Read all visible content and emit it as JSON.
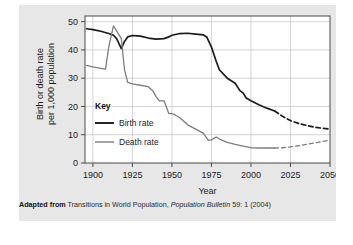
{
  "figure": {
    "y_axis_label_line1": "Birth or death rate",
    "y_axis_label_line2": "per 1,000 population",
    "x_axis_label": "Year",
    "key_title": "Key",
    "caption_prefix": "Adapted from",
    "caption_source": "Transitions in World Population,",
    "caption_italic": "Population Bulletin",
    "caption_suffix": "59: 1 (2004)"
  },
  "colors": {
    "panel_background": "#e7e7e7",
    "plot_background": "#ffffff",
    "gridline": "#c9c9c9",
    "axis": "#4a4a4a",
    "birth_rate_line": "#1b1b1b",
    "death_rate_line": "#7d7d7d",
    "text": "#1b1b1b"
  },
  "chart_data": {
    "type": "line",
    "title": "",
    "xlabel": "Year",
    "ylabel": "Birth or death rate per 1,000 population",
    "xlim": [
      1895,
      2050
    ],
    "ylim": [
      0,
      52
    ],
    "xticks": [
      1900,
      1925,
      1950,
      1975,
      2000,
      2025,
      2050
    ],
    "xtick_labels": [
      "1900",
      "1925",
      "1950",
      "1975",
      "2000",
      "2025",
      "2050"
    ],
    "yticks": [
      0,
      10,
      20,
      30,
      40,
      50
    ],
    "ytick_labels": [
      "0",
      "10",
      "20",
      "30",
      "40",
      "50"
    ],
    "grid": true,
    "legend_position": "inside-lower-left",
    "series": [
      {
        "name": "Birth rate",
        "color": "#1b1b1b",
        "style": "solid",
        "x": [
          1896,
          1900,
          1905,
          1910,
          1913,
          1915,
          1918,
          1920,
          1922,
          1925,
          1928,
          1930,
          1935,
          1940,
          1945,
          1948,
          1950,
          1955,
          1960,
          1965,
          1970,
          1972,
          1975,
          1978,
          1980,
          1985,
          1990,
          1993,
          1995,
          1997,
          2000,
          2005,
          2010,
          2015
        ],
        "y": [
          47.5,
          47.2,
          46.6,
          45.8,
          45.2,
          44.0,
          40.5,
          43.0,
          44.6,
          45.1,
          45.0,
          44.9,
          44.2,
          43.8,
          44.0,
          44.6,
          45.2,
          45.8,
          45.9,
          45.6,
          45.3,
          44.6,
          41.0,
          36.0,
          33.0,
          30.0,
          28.2,
          25.6,
          24.8,
          23.0,
          22.0,
          20.6,
          19.4,
          18.4
        ]
      },
      {
        "name": "Birth rate (projected)",
        "color": "#1b1b1b",
        "style": "dashed",
        "x": [
          2015,
          2020,
          2025,
          2030,
          2035,
          2040,
          2045,
          2050
        ],
        "y": [
          18.4,
          16.5,
          15.0,
          14.0,
          13.3,
          12.7,
          12.3,
          12.0
        ]
      },
      {
        "name": "Death rate",
        "color": "#7d7d7d",
        "style": "solid",
        "x": [
          1896,
          1900,
          1905,
          1908,
          1910,
          1913,
          1918,
          1920,
          1922,
          1925,
          1930,
          1935,
          1938,
          1940,
          1942,
          1945,
          1948,
          1950,
          1952,
          1955,
          1960,
          1965,
          1970,
          1973,
          1975,
          1978,
          1980,
          1982,
          1985,
          1990,
          1995,
          2000,
          2005,
          2010,
          2015
        ],
        "y": [
          34.5,
          34.0,
          33.5,
          33.2,
          41.0,
          48.5,
          44.0,
          33.0,
          28.5,
          28.0,
          27.5,
          27.0,
          25.5,
          23.5,
          22.0,
          22.0,
          17.5,
          17.5,
          17.0,
          16.0,
          13.5,
          12.0,
          10.5,
          8.0,
          8.2,
          9.2,
          8.5,
          8.0,
          7.3,
          6.6,
          6.0,
          5.4,
          5.3,
          5.3,
          5.3
        ]
      },
      {
        "name": "Death rate (projected)",
        "color": "#7d7d7d",
        "style": "dashed",
        "x": [
          2015,
          2020,
          2025,
          2030,
          2035,
          2040,
          2045,
          2050
        ],
        "y": [
          5.3,
          5.4,
          5.7,
          6.1,
          6.6,
          7.1,
          7.6,
          8.1
        ]
      }
    ],
    "legend_entries": [
      {
        "label": "Birth rate",
        "color": "#1b1b1b"
      },
      {
        "label": "Death rate",
        "color": "#7d7d7d"
      }
    ]
  }
}
